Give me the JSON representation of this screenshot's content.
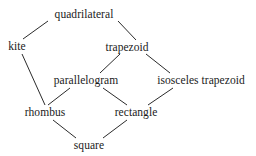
{
  "diagram": {
    "background_color": "#ffffff",
    "text_color": "#1a1a1a",
    "edge_color": "#2b2b2b",
    "nodes": [
      {
        "id": "quadrilateral",
        "label": "quadrilateral",
        "x": 84,
        "y": 14
      },
      {
        "id": "kite",
        "label": "kite",
        "x": 17,
        "y": 46
      },
      {
        "id": "trapezoid",
        "label": "trapezoid",
        "x": 127,
        "y": 47
      },
      {
        "id": "parallelogram",
        "label": "parallelogram",
        "x": 86,
        "y": 80
      },
      {
        "id": "isosceles_trapezoid",
        "label": "isosceles trapezoid",
        "x": 201,
        "y": 80
      },
      {
        "id": "rhombus",
        "label": "rhombus",
        "x": 45,
        "y": 112
      },
      {
        "id": "rectangle",
        "label": "rectangle",
        "x": 136,
        "y": 112
      },
      {
        "id": "square",
        "label": "square",
        "x": 89,
        "y": 145
      }
    ],
    "edges": [
      {
        "from": "quadrilateral",
        "to": "kite",
        "x1": 48,
        "y1": 21,
        "x2": 23,
        "y2": 39
      },
      {
        "from": "quadrilateral",
        "to": "trapezoid",
        "x1": 118,
        "y1": 21,
        "x2": 136,
        "y2": 40
      },
      {
        "from": "trapezoid",
        "to": "parallelogram",
        "x1": 120,
        "y1": 54,
        "x2": 100,
        "y2": 73
      },
      {
        "from": "trapezoid",
        "to": "isosceles_trapezoid",
        "x1": 146,
        "y1": 54,
        "x2": 170,
        "y2": 73
      },
      {
        "from": "kite",
        "to": "rhombus",
        "x1": 22,
        "y1": 54,
        "x2": 45,
        "y2": 105
      },
      {
        "from": "parallelogram",
        "to": "rhombus",
        "x1": 70,
        "y1": 88,
        "x2": 48,
        "y2": 105
      },
      {
        "from": "parallelogram",
        "to": "rectangle",
        "x1": 103,
        "y1": 88,
        "x2": 127,
        "y2": 105
      },
      {
        "from": "isosceles_trapezoid",
        "to": "rectangle",
        "x1": 173,
        "y1": 88,
        "x2": 148,
        "y2": 105
      },
      {
        "from": "rhombus",
        "to": "square",
        "x1": 53,
        "y1": 120,
        "x2": 76,
        "y2": 138
      },
      {
        "from": "rectangle",
        "to": "square",
        "x1": 127,
        "y1": 120,
        "x2": 103,
        "y2": 138
      }
    ]
  }
}
